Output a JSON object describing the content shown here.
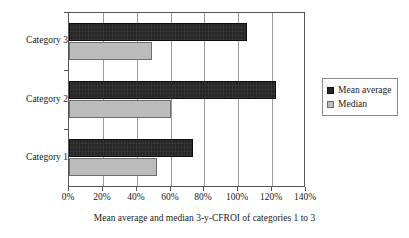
{
  "chart_data": {
    "type": "bar",
    "orientation": "horizontal",
    "title": "",
    "xlabel": "Mean average and median 3-y-CFROI of categories 1 to 3",
    "ylabel": "",
    "categories": [
      "Category 1",
      "Category 2",
      "Category 3"
    ],
    "series": [
      {
        "name": "Mean average",
        "values": [
          73,
          122,
          105
        ],
        "color": "#262626"
      },
      {
        "name": "Median",
        "values": [
          52,
          60,
          49
        ],
        "color": "#bcbcbc"
      }
    ],
    "xlim": [
      0,
      140
    ],
    "xticks": [
      0,
      20,
      40,
      60,
      80,
      100,
      120,
      140
    ],
    "xtick_labels": [
      "0%",
      "20%",
      "40%",
      "60%",
      "80%",
      "100%",
      "120%",
      "140%"
    ],
    "value_unit": "%",
    "grid": "vertical",
    "legend_position": "right",
    "legend_entries": [
      "Mean average",
      "Median"
    ]
  },
  "legend": {
    "entries": [
      {
        "label": "Mean average",
        "swatch": "mean"
      },
      {
        "label": "Median",
        "swatch": "median"
      }
    ]
  }
}
